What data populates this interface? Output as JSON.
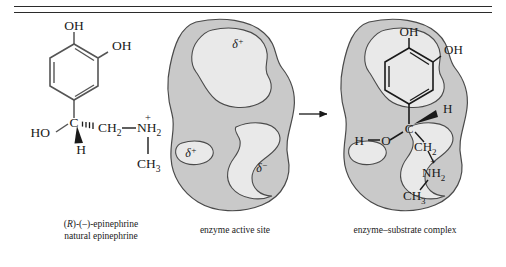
{
  "figure": {
    "rule": {
      "style": "double-horizontal"
    },
    "arrow": {
      "direction": "right",
      "label": ""
    }
  },
  "captions": {
    "left_line1_prefix": "(",
    "left_line1_italic": "R",
    "left_line1_suffix": ")-(–)-epinephrine",
    "left_line2": "natural epinephrine",
    "middle": "enzyme active site",
    "right": "enzyme–substrate complex"
  },
  "structure": {
    "name": "(R)-(–)-epinephrine",
    "labels": {
      "oh_top": "OH",
      "oh_side": "OH",
      "ho": "HO",
      "stereocenter": "C",
      "h": "H",
      "ch2": "CH",
      "ch2_sub": "2",
      "n": "NH",
      "n_sub": "2",
      "n_charge": "+",
      "ch3": "CH",
      "ch3_sub": "3"
    },
    "bonds": {
      "to_ch2": "hashed-wedge",
      "to_h": "bold-wedge",
      "ring": "kekule-benzene"
    }
  },
  "active_site": {
    "pockets": [
      {
        "id": "pocket-top",
        "label": "δ",
        "charge": "+"
      },
      {
        "id": "pocket-left-small",
        "label": "δ",
        "charge": "+"
      },
      {
        "id": "pocket-bottom",
        "label": "δ",
        "charge": "−"
      }
    ]
  },
  "complex": {
    "pockets": [
      {
        "id": "complex-pocket-top",
        "contents": "catechol-ring"
      },
      {
        "id": "complex-pocket-left-small",
        "contents": "hydroxyl"
      },
      {
        "id": "complex-pocket-bottom",
        "contents": "ammonium-side-chain"
      }
    ],
    "labels": {
      "oh_top": "OH",
      "oh_side": "OH",
      "stereocenter": "C",
      "h": "H",
      "h_of_oh": "H",
      "o": "O",
      "ch2": "CH",
      "ch2_sub": "2",
      "n": "NH",
      "n_sub": "2",
      "n_charge": "+",
      "ch3": "CH",
      "ch3_sub": "3"
    }
  },
  "colors": {
    "ink": "#1a1a1a",
    "blob_fill": "#c9c9c9",
    "pocket_fill": "#e9e9e9",
    "outline": "#4a4a4a",
    "background": "#ffffff"
  }
}
